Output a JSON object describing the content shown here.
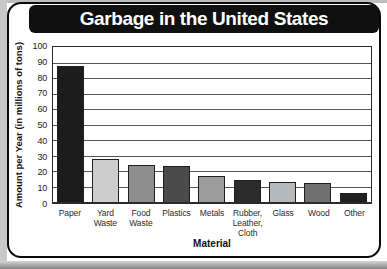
{
  "chart_data": {
    "type": "bar",
    "title": "Garbage in the United States",
    "xlabel": "Material",
    "ylabel": "Amount per Year (in millions of tons)",
    "ylim": [
      0,
      100
    ],
    "ytick_step": 10,
    "yticks": [
      100,
      90,
      80,
      70,
      60,
      50,
      40,
      30,
      20,
      10,
      0
    ],
    "grid": true,
    "legend": "none",
    "categories": [
      "Paper",
      "Yard\nWaste",
      "Food\nWaste",
      "Plastics",
      "Metals",
      "Rubber,\nLeather,\nCloth",
      "Glass",
      "Wood",
      "Other"
    ],
    "values": [
      88,
      28,
      24,
      23,
      17,
      14,
      13,
      12,
      6
    ],
    "bar_colors": [
      "#1c1c1c",
      "#cdcdcd",
      "#8d8d8d",
      "#4b4b4b",
      "#9b9b9b",
      "#2b2b2b",
      "#b4b9b9",
      "#6f6f6f",
      "#202020"
    ]
  },
  "colors": {
    "banner_bg": "#101010",
    "banner_text": "#ffffff",
    "card_border": "#0a0a0a",
    "grid_color": "#555555",
    "plot_frame": "#2b2b2b"
  }
}
